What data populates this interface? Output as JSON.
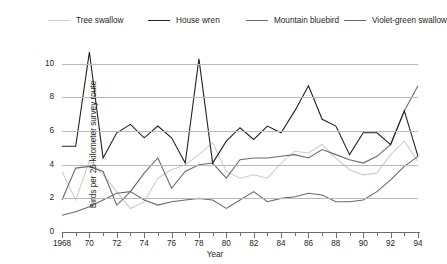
{
  "chart_data": {
    "type": "line",
    "title": "",
    "xlabel": "Year",
    "ylabel": "Birds per 25-kilometer survey route",
    "xlim": [
      1968,
      1994
    ],
    "ylim": [
      0,
      11
    ],
    "yticks": [
      0,
      2,
      4,
      6,
      8,
      10
    ],
    "xticks": [
      1968,
      1970,
      1972,
      1974,
      1976,
      1978,
      1980,
      1982,
      1984,
      1986,
      1988,
      1990,
      1992,
      1994
    ],
    "xtick_labels": [
      "1968",
      "70",
      "72",
      "74",
      "76",
      "78",
      "80",
      "82",
      "84",
      "86",
      "88",
      "90",
      "92",
      "94"
    ],
    "grid": true,
    "legend_position": "top",
    "x": [
      1968,
      1969,
      1970,
      1971,
      1972,
      1973,
      1974,
      1975,
      1976,
      1977,
      1978,
      1979,
      1980,
      1981,
      1982,
      1983,
      1984,
      1985,
      1986,
      1987,
      1988,
      1989,
      1990,
      1991,
      1992,
      1993,
      1994
    ],
    "series": [
      {
        "name": "Tree swallow",
        "color": "#cfcfcf",
        "values": [
          3.6,
          1.9,
          4.2,
          3.4,
          2.4,
          1.4,
          1.8,
          3.2,
          3.7,
          4.0,
          4.6,
          5.3,
          3.6,
          3.2,
          3.4,
          3.2,
          4.1,
          4.8,
          4.7,
          5.2,
          4.4,
          3.7,
          3.4,
          3.5,
          4.6,
          5.4,
          4.2
        ]
      },
      {
        "name": "House wren",
        "color": "#231f20",
        "values": [
          5.1,
          5.1,
          10.7,
          4.4,
          5.9,
          6.4,
          5.6,
          6.3,
          5.6,
          4.1,
          10.3,
          4.1,
          5.4,
          6.2,
          5.5,
          6.3,
          5.9,
          7.2,
          8.7,
          6.7,
          6.3,
          4.6,
          5.9,
          5.9,
          5.2,
          7.2,
          4.5
        ]
      },
      {
        "name": "Mountain bluebird",
        "color": "#6a6a6a",
        "values": [
          1.9,
          3.8,
          3.9,
          3.6,
          1.6,
          2.4,
          3.5,
          4.4,
          2.6,
          3.6,
          4.0,
          4.1,
          3.2,
          4.3,
          4.4,
          4.4,
          4.5,
          4.6,
          4.4,
          4.9,
          4.6,
          4.3,
          4.1,
          4.5,
          5.2,
          7.2,
          8.7
        ]
      },
      {
        "name": "Violet-green swallow",
        "color": "#6a6a6a",
        "values": [
          1.0,
          1.2,
          1.5,
          1.9,
          2.3,
          2.4,
          1.9,
          1.6,
          1.8,
          1.9,
          2.0,
          1.9,
          1.4,
          1.9,
          2.4,
          1.8,
          2.0,
          2.1,
          2.3,
          2.2,
          1.8,
          1.8,
          1.9,
          2.4,
          3.1,
          3.9,
          4.5
        ]
      }
    ]
  },
  "legend": {
    "items": [
      {
        "label": "Tree swallow"
      },
      {
        "label": "House wren"
      },
      {
        "label": "Mountain bluebird"
      },
      {
        "label": "Violet-green swallow"
      }
    ]
  }
}
